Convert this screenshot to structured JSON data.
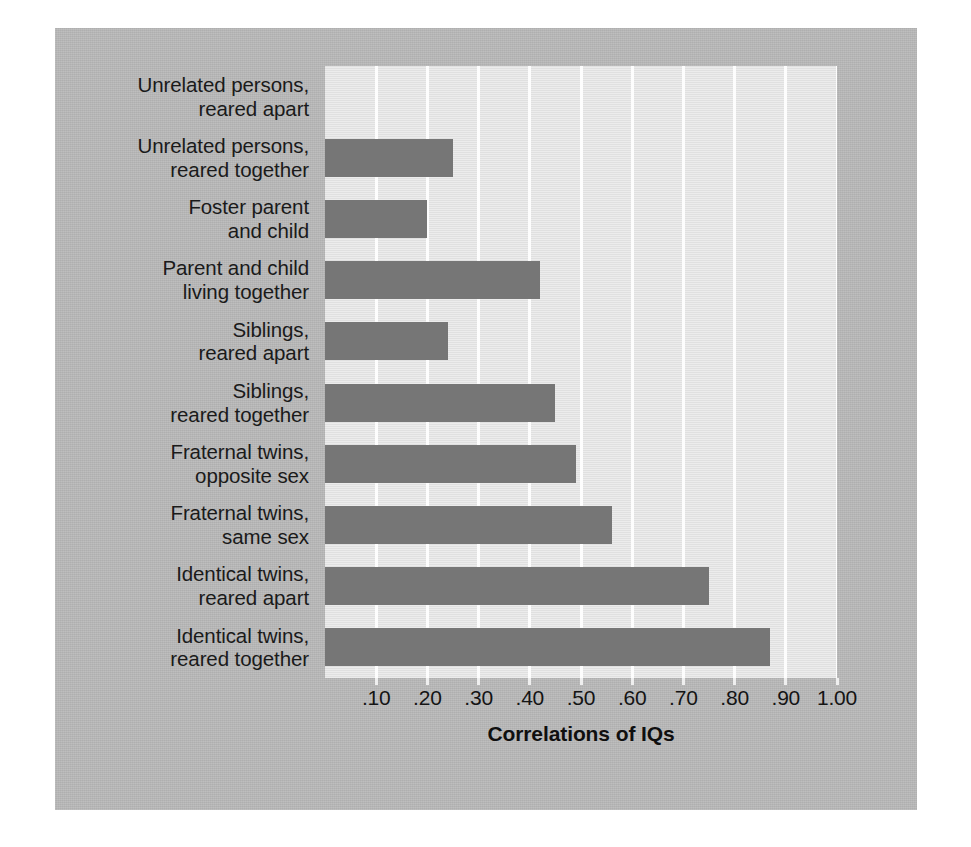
{
  "chart_data": {
    "type": "bar",
    "orientation": "horizontal",
    "title": "",
    "xlabel": "Correlations of IQs",
    "ylabel": "",
    "xlim": [
      0,
      1.0
    ],
    "grid": true,
    "legend": null,
    "categories": [
      "Unrelated persons, reared apart",
      "Unrelated persons, reared together",
      "Foster parent and child",
      "Parent and child living together",
      "Siblings, reared apart",
      "Siblings, reared together",
      "Fraternal twins, opposite sex",
      "Fraternal twins, same sex",
      "Identical twins, reared apart",
      "Identical twins, reared together"
    ],
    "values": [
      0.0,
      0.25,
      0.2,
      0.42,
      0.24,
      0.45,
      0.49,
      0.56,
      0.75,
      0.87
    ],
    "xticks": [
      0.1,
      0.2,
      0.3,
      0.4,
      0.5,
      0.6,
      0.7,
      0.8,
      0.9,
      1.0
    ],
    "xticklabels": [
      ".10",
      ".20",
      ".30",
      ".40",
      ".50",
      ".60",
      ".70",
      ".80",
      ".90",
      "1.00"
    ],
    "bar_color": "#767676",
    "plot_background": "#e4e4e4",
    "gridline_color": "#fdfdfd",
    "figure_background": "#b9b9b9"
  },
  "category_lines": [
    [
      "Unrelated persons,",
      "reared apart"
    ],
    [
      "Unrelated persons,",
      "reared together"
    ],
    [
      "Foster parent",
      "and child"
    ],
    [
      "Parent and child",
      "living together"
    ],
    [
      "Siblings,",
      "reared apart"
    ],
    [
      "Siblings,",
      "reared together"
    ],
    [
      "Fraternal twins,",
      "opposite sex"
    ],
    [
      "Fraternal twins,",
      "same sex"
    ],
    [
      "Identical twins,",
      "reared apart"
    ],
    [
      "Identical twins,",
      "reared together"
    ]
  ]
}
